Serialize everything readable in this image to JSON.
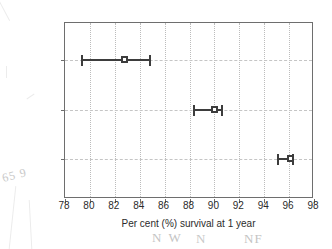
{
  "chart_data": {
    "type": "scatter",
    "title": "",
    "xlabel": "Per cent (%) survival at 1 year",
    "ylabel": "",
    "xlim": [
      78,
      98
    ],
    "ylim": [
      0,
      3
    ],
    "grid": "vertical dotted gridlines at every x tick; light dashed horizontal reference line at each category row",
    "legend": "none",
    "orientation": "horizontal",
    "categories": [
      "Neonates",
      "Infants",
      "Children"
    ],
    "xticks": [
      78,
      80,
      82,
      84,
      86,
      88,
      90,
      92,
      94,
      96,
      98
    ],
    "xtick_labels": [
      "78",
      "80",
      "82",
      "84",
      "86",
      "88",
      "90",
      "92",
      "94",
      "96",
      "98"
    ],
    "series": [
      {
        "name": "Per cent (%) survival at 1 year",
        "points": [
          {
            "category": "Neonates",
            "value": 82.8,
            "ci_low": 79.4,
            "ci_high": 84.8
          },
          {
            "category": "Infants",
            "value": 90.0,
            "ci_low": 88.4,
            "ci_high": 90.6
          },
          {
            "category": "Children",
            "value": 96.1,
            "ci_low": 95.1,
            "ci_high": 96.3
          }
        ]
      }
    ],
    "marker": "open square with error bars and end caps",
    "colors": {
      "marker": "#3d3d3d",
      "error_bar": "#3d3d3d",
      "axis": "#6e6e6e",
      "gridline": "#bcbcbc",
      "rowline": "#c5c5c5",
      "text": "#2b2b2b",
      "background": "#ffffff"
    }
  },
  "annotations": {
    "pencil_marks": [
      "N W",
      "N",
      "NF"
    ],
    "margin_scribble": "65 9"
  }
}
